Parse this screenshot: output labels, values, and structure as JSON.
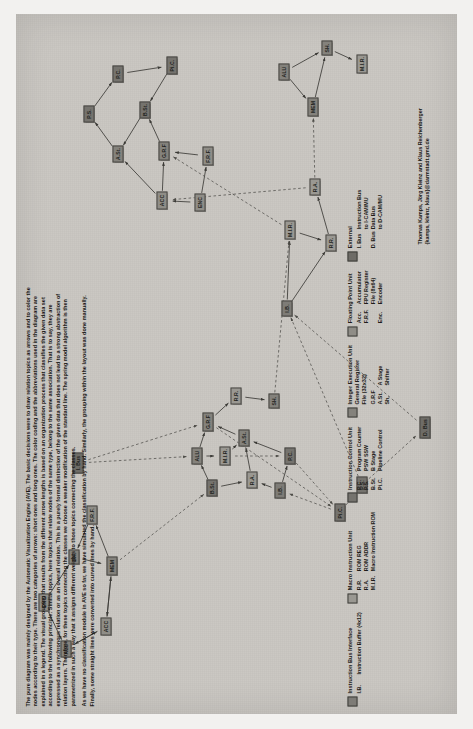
{
  "figure": {
    "paper_color": "#c9c6c1",
    "node_border_color": "#4a4944"
  },
  "description": {
    "paragraphs": [
      "The pure diagram was mainly designed by the Automatic Visualization Engine (AVE). The basic decisions were to draw relation topics as arrows and to color the nodes according to their type. There are two categories of arrows: short ones and long ones. The color coding and the abbreviations used in the diagram are explained in a legend. The visual grouping that results from the different arrow lengths is based on an organization process that classifies the given data set according to the following principle: Similar topics, here topics that relate nodes of the same type, belong to the same association. That is to say, they are expressed as a synchronous relation or as an overall relation. This is a purely formal distinction of the given data that does not lead to a strong abstraction of relation layers. Therefore, for these topics connecting the classes we choose a weaker modification of the standard line. The spring model algorithm is then parametrized in such a way that it assigns different weights to those topics connecting the classes.",
      "As we have no classification module in AVE so far, we have simulated the classification by hand. Similarly, the grouping within the layout was done manually. Finally, some straight lines were converted into curved lines by hand."
    ]
  },
  "credit": {
    "lines": [
      "Thomas Kamps, Jörg Kleinz and Klaus Reichenberger",
      "{kamps, kleinz, klaus}@darmstadt.gmd.de"
    ]
  },
  "legend": {
    "groups": [
      {
        "swatch_color": "#7e7c77",
        "title_lines": [
          "Instruction Bus Interface"
        ],
        "rows": [
          {
            "abbr": "I.B.",
            "text": "Instruction Buffer (4x12)"
          }
        ]
      },
      {
        "swatch_color": "#9a9892",
        "title_lines": [
          "Macro Instruction Unit"
        ],
        "rows": [
          {
            "abbr": "R.R.",
            "text": "ROM REG"
          },
          {
            "abbr": "R.A.",
            "text": "ROM ADDR"
          },
          {
            "abbr": "M.I.R.",
            "text": "Macro Instruction ROM"
          }
        ]
      },
      {
        "swatch_color": "#75736e",
        "title_lines": [
          "Instruction Control Unit"
        ],
        "rows": [
          {
            "abbr": "P.C.",
            "text": "Program Counter"
          },
          {
            "abbr": "P.S.",
            "text": "PSW SSW"
          },
          {
            "abbr": "B.St.",
            "text": "B Stage"
          },
          {
            "abbr": "Pi.C.",
            "text": "Pipeline Control"
          }
        ]
      },
      {
        "swatch_color": "#84827c",
        "title_lines": [
          "Integer Execution Unit",
          "General Register",
          "File (32x32)"
        ],
        "rows": [
          {
            "abbr": "G.R.F",
            "text": ""
          },
          {
            "abbr": "A.St.",
            "text": "A Stage"
          },
          {
            "abbr": "Sh.",
            "text": "Shifter"
          }
        ]
      },
      {
        "swatch_color": "#8f8d87",
        "title_lines": [
          "Floating Point Unit"
        ],
        "rows": [
          {
            "abbr": "Acc.",
            "text": "Accumulator"
          },
          {
            "abbr": "F.R.F.",
            "text": "FPU Register"
          },
          {
            "abbr": "",
            "text": "File (8x64)"
          },
          {
            "abbr": "Enc.",
            "text": "Encoder"
          }
        ]
      },
      {
        "swatch_color": "#6e6c67",
        "title_lines": [
          "External"
        ],
        "rows": [
          {
            "abbr": "I. Bus",
            "text": "Instruction Bus"
          },
          {
            "abbr": "",
            "text": "to I-CAM/MU"
          },
          {
            "abbr": "D. Bus",
            "text": "Data Bus"
          },
          {
            "abbr": "",
            "text": "to D-CAM/MU"
          }
        ]
      }
    ]
  },
  "graph": {
    "nodes": [
      {
        "id": "alu",
        "label": "ALU",
        "cls": "n-ieu",
        "x": 57,
        "y": 44,
        "w": 17
      },
      {
        "id": "enc",
        "label": "ENC",
        "cls": "n-fpu",
        "x": 103,
        "y": 22,
        "w": 18
      },
      {
        "id": "acc",
        "label": "ACC",
        "cls": "n-fpu",
        "x": 79,
        "y": 84,
        "w": 18
      },
      {
        "id": "sh2",
        "label": "SH.",
        "cls": "n-ieu",
        "x": 150,
        "y": 52,
        "w": 15
      },
      {
        "id": "frf",
        "label": "F.R.F.",
        "cls": "n-fpu",
        "x": 190,
        "y": 70,
        "w": 19
      },
      {
        "id": "mem",
        "label": "MEM",
        "cls": "n-ieu",
        "x": 139,
        "y": 90,
        "w": 19
      },
      {
        "id": "ibus",
        "label": "I. Bus",
        "cls": "n-ext",
        "x": 241,
        "y": 56,
        "w": 21
      },
      {
        "id": "bst",
        "label": "B.St.",
        "cls": "n-icu",
        "x": 218,
        "y": 190,
        "w": 17
      },
      {
        "id": "alu2",
        "label": "ALU",
        "cls": "n-ieu",
        "x": 250,
        "y": 175,
        "w": 17
      },
      {
        "id": "mir",
        "label": "M.I.R.",
        "cls": "n-miu",
        "x": 249,
        "y": 203,
        "w": 19
      },
      {
        "id": "grf",
        "label": "G.R.F",
        "cls": "n-ieu",
        "x": 283,
        "y": 186,
        "w": 19
      },
      {
        "id": "ast",
        "label": "A.St.",
        "cls": "n-ieu",
        "x": 268,
        "y": 222,
        "w": 17
      },
      {
        "id": "ra",
        "label": "R.A.",
        "cls": "n-miu",
        "x": 226,
        "y": 230,
        "w": 17
      },
      {
        "id": "rr",
        "label": "R.R.",
        "cls": "n-miu",
        "x": 310,
        "y": 214,
        "w": 17
      },
      {
        "id": "sh3",
        "label": "SH.",
        "cls": "n-ieu",
        "x": 306,
        "y": 252,
        "w": 15
      },
      {
        "id": "ib2",
        "label": "I.B.",
        "cls": "n-ibi",
        "x": 216,
        "y": 258,
        "w": 16
      },
      {
        "id": "pc",
        "label": "P.C.",
        "cls": "n-icu",
        "x": 250,
        "y": 268,
        "w": 17
      },
      {
        "id": "pic",
        "label": "Pi.C.",
        "cls": "n-icu",
        "x": 193,
        "y": 318,
        "w": 18
      },
      {
        "id": "ps",
        "label": "P.S.",
        "cls": "n-icu",
        "x": 221,
        "y": 340,
        "w": 17
      },
      {
        "id": "dbus",
        "label": "D. Bus",
        "cls": "n-ext",
        "x": 276,
        "y": 403,
        "w": 22
      },
      {
        "id": "ib3",
        "label": "I.B.",
        "cls": "n-ibi",
        "x": 398,
        "y": 265,
        "w": 16
      },
      {
        "id": "mir2",
        "label": "M.I.R.",
        "cls": "n-miu",
        "x": 475,
        "y": 268,
        "w": 19
      },
      {
        "id": "rr2",
        "label": "R.R.",
        "cls": "n-miu",
        "x": 463,
        "y": 309,
        "w": 17
      },
      {
        "id": "ra2",
        "label": "R.A.",
        "cls": "n-miu",
        "x": 519,
        "y": 293,
        "w": 17
      },
      {
        "id": "bst2",
        "label": "B.St.",
        "cls": "n-icu",
        "x": 596,
        "y": 123,
        "w": 17
      },
      {
        "id": "pic2",
        "label": "Pi.C.",
        "cls": "n-icu",
        "x": 640,
        "y": 150,
        "w": 18
      },
      {
        "id": "pc2",
        "label": "P.C.",
        "cls": "n-icu",
        "x": 632,
        "y": 96,
        "w": 17
      },
      {
        "id": "ps2",
        "label": "P.S.",
        "cls": "n-icu",
        "x": 592,
        "y": 67,
        "w": 17
      },
      {
        "id": "ast2",
        "label": "A.St.",
        "cls": "n-ieu",
        "x": 552,
        "y": 96,
        "w": 17
      },
      {
        "id": "grf2",
        "label": "G.R.F",
        "cls": "n-ieu",
        "x": 554,
        "y": 142,
        "w": 19
      },
      {
        "id": "acc2",
        "label": "ACC",
        "cls": "n-fpu",
        "x": 505,
        "y": 140,
        "w": 18
      },
      {
        "id": "enc2",
        "label": "ENC",
        "cls": "n-fpu",
        "x": 503,
        "y": 178,
        "w": 18
      },
      {
        "id": "frf2",
        "label": "F.R.F.",
        "cls": "n-fpu",
        "x": 549,
        "y": 186,
        "w": 19
      },
      {
        "id": "mem3",
        "label": "MEM",
        "cls": "n-ieu",
        "x": 598,
        "y": 291,
        "w": 19
      },
      {
        "id": "alu3",
        "label": "ALU",
        "cls": "n-ieu",
        "x": 634,
        "y": 262,
        "w": 17
      },
      {
        "id": "sh4",
        "label": "SH.",
        "cls": "n-ieu",
        "x": 659,
        "y": 305,
        "w": 15
      },
      {
        "id": "mir3",
        "label": "M.I.R.",
        "cls": "n-miu",
        "x": 641,
        "y": 340,
        "w": 19
      }
    ],
    "solid_edges": [
      [
        "enc",
        "alu"
      ],
      [
        "enc",
        "sh2"
      ],
      [
        "alu",
        "acc"
      ],
      [
        "acc",
        "alu"
      ],
      [
        "acc",
        "mem"
      ],
      [
        "sh2",
        "mem"
      ],
      [
        "mem",
        "frf"
      ],
      [
        "frf",
        "sh2"
      ],
      [
        "mem",
        "acc"
      ],
      [
        "bst",
        "alu2"
      ],
      [
        "alu2",
        "grf"
      ],
      [
        "alu2",
        "mir"
      ],
      [
        "mir",
        "ast"
      ],
      [
        "grf",
        "rr"
      ],
      [
        "rr",
        "sh3"
      ],
      [
        "ast",
        "grf"
      ],
      [
        "ra",
        "ast"
      ],
      [
        "ib2",
        "ra"
      ],
      [
        "pc",
        "ast"
      ],
      [
        "ib2",
        "pc"
      ],
      [
        "bst",
        "ra"
      ],
      [
        "ib3",
        "mir2"
      ],
      [
        "mir2",
        "rr2"
      ],
      [
        "rr2",
        "ra2"
      ],
      [
        "ib3",
        "rr2"
      ],
      [
        "ast2",
        "ps2"
      ],
      [
        "ps2",
        "pc2"
      ],
      [
        "pc2",
        "pic2"
      ],
      [
        "pic2",
        "bst2"
      ],
      [
        "bst2",
        "ast2"
      ],
      [
        "grf2",
        "bst2"
      ],
      [
        "acc2",
        "grf2"
      ],
      [
        "enc2",
        "acc2"
      ],
      [
        "enc2",
        "frf2"
      ],
      [
        "frf2",
        "grf2"
      ],
      [
        "acc2",
        "ast2"
      ],
      [
        "alu3",
        "mem3"
      ],
      [
        "mem3",
        "sh4"
      ],
      [
        "sh4",
        "mir3"
      ],
      [
        "alu3",
        "sh4"
      ]
    ],
    "dashed_edges": [
      [
        "mem",
        "bst"
      ],
      [
        "ibus",
        "alu2"
      ],
      [
        "ibus",
        "grf"
      ],
      [
        "grf",
        "pic"
      ],
      [
        "pic",
        "ps"
      ],
      [
        "pic",
        "ib2"
      ],
      [
        "ps",
        "dbus"
      ],
      [
        "dbus",
        "ib3"
      ],
      [
        "mir",
        "pc"
      ],
      [
        "sh3",
        "mir2"
      ],
      [
        "ra2",
        "acc2"
      ],
      [
        "mir2",
        "grf2"
      ],
      [
        "pc",
        "pic"
      ],
      [
        "ps",
        "ib3"
      ],
      [
        "ra2",
        "mem3"
      ]
    ]
  }
}
